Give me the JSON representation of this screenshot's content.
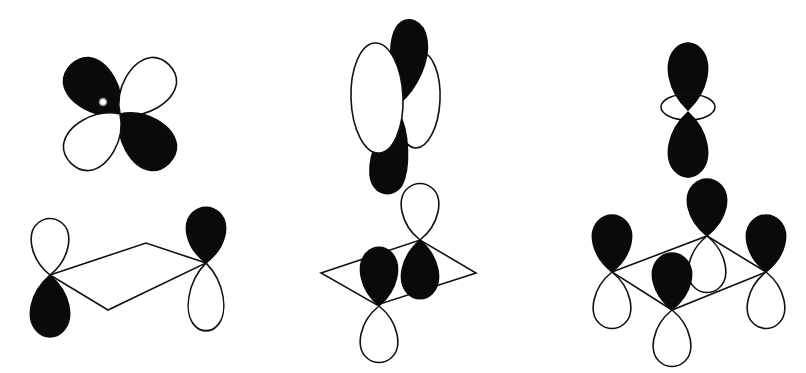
{
  "diagram": {
    "title": "",
    "colors": {
      "filled": "#0a0a0a",
      "outline": "#111111",
      "background": "#ffffff"
    },
    "panels": [
      {
        "id": "d-orbital-and-pi-sigma",
        "top": {
          "type": "d-orbital",
          "center": [
            120,
            114
          ],
          "lobes": [
            {
              "angle": -135,
              "filled": true
            },
            {
              "angle": -45,
              "filled": false
            },
            {
              "angle": 45,
              "filled": true
            },
            {
              "angle": 135,
              "filled": false
            }
          ],
          "small_ring": [
            103,
            102
          ]
        },
        "bottom": {
          "type": "ligand-pair",
          "rhombus": [
            [
              50,
              275
            ],
            [
              146,
              243
            ],
            [
              206,
              263
            ],
            [
              108,
              310
            ]
          ],
          "p_orbitals": [
            {
              "at": [
                50,
                275
              ],
              "up_filled": false,
              "down_filled": true
            },
            {
              "at": [
                206,
                263
              ],
              "up_filled": true,
              "down_filled": false
            }
          ]
        }
      },
      {
        "id": "d-orbital-tilted-and-pi-pair",
        "top": {
          "type": "tilted-d",
          "center": [
            400,
            110
          ]
        },
        "bottom": {
          "type": "rhombus-pi",
          "rhombus": [
            [
              321,
              273
            ],
            [
              420,
              240
            ],
            [
              476,
              273
            ],
            [
              377,
              305
            ]
          ],
          "p_orbitals": [
            {
              "at": [
                420,
                240
              ],
              "up_filled": false,
              "down_filled": true
            },
            {
              "at": [
                379,
                306
              ],
              "up_filled": true,
              "down_filled": false
            }
          ]
        }
      },
      {
        "id": "dz2-and-four-p",
        "top": {
          "type": "dz2",
          "center": [
            688,
            110
          ]
        },
        "bottom": {
          "type": "rhombus-four",
          "rhombus": [
            [
              612,
              272
            ],
            [
              707,
              236
            ],
            [
              766,
              272
            ],
            [
              672,
              310
            ]
          ],
          "p_orbitals": [
            {
              "at": [
                612,
                272
              ],
              "up_filled": true,
              "down_filled": false
            },
            {
              "at": [
                707,
                236
              ],
              "up_filled": true,
              "down_filled": false
            },
            {
              "at": [
                766,
                272
              ],
              "up_filled": true,
              "down_filled": false
            },
            {
              "at": [
                672,
                310
              ],
              "up_filled": true,
              "down_filled": false
            }
          ]
        }
      }
    ]
  }
}
